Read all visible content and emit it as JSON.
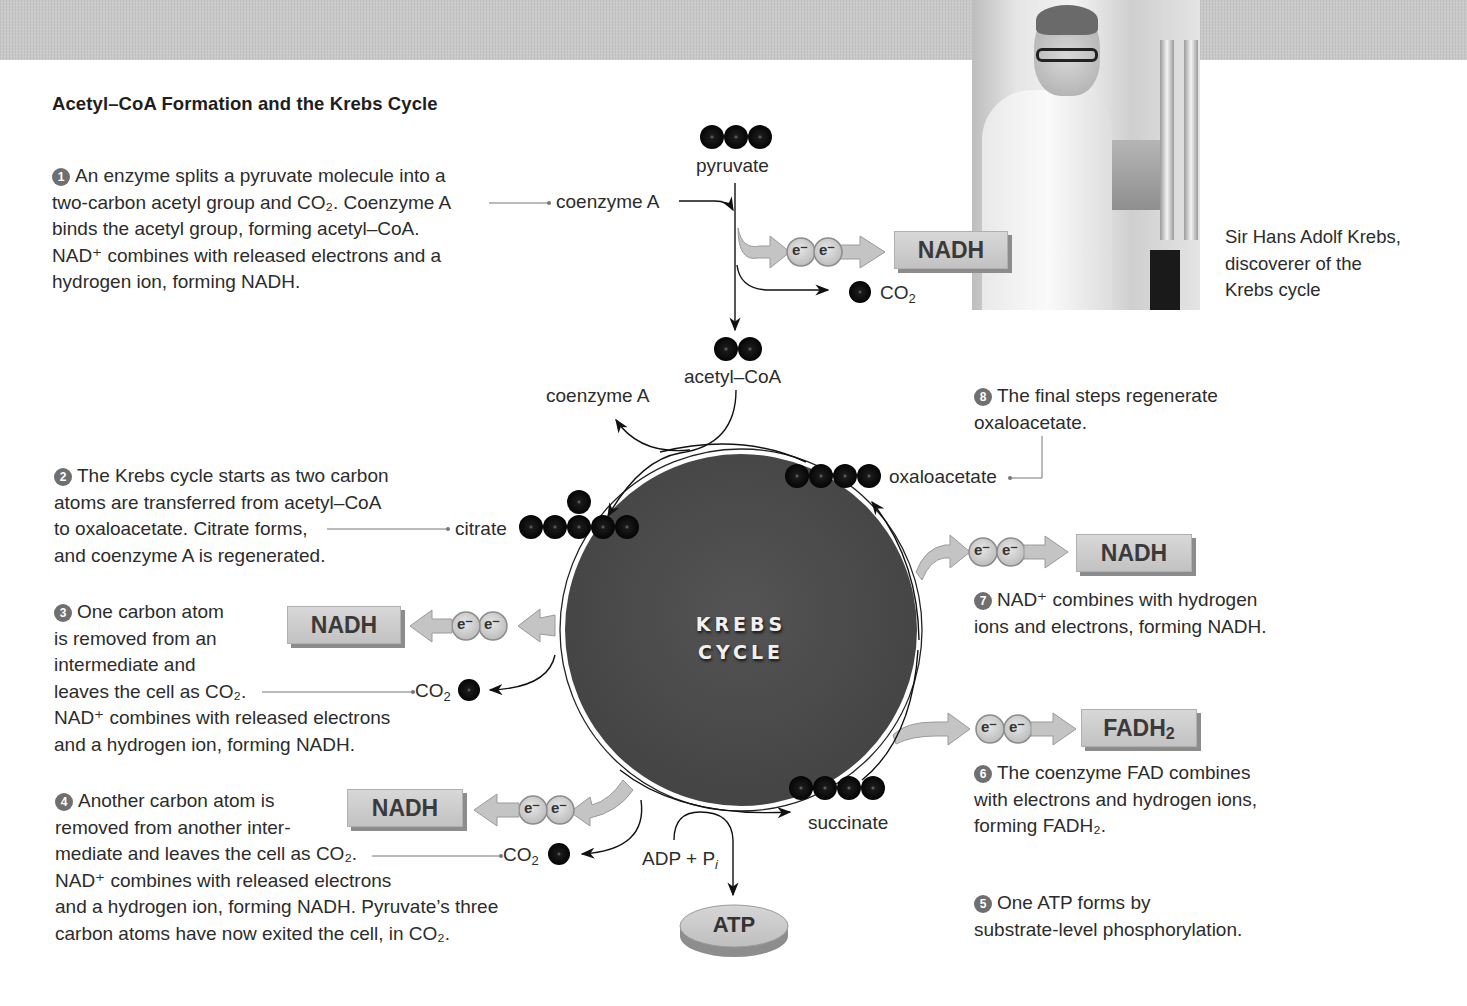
{
  "title": "Acetyl–CoA Formation and the Krebs Cycle",
  "photo_caption": {
    "line1": "Sir Hans Adolf Krebs,",
    "line2": "discoverer of the",
    "line3": "Krebs cycle"
  },
  "cycle_label": {
    "line1": "KREBS",
    "line2": "CYCLE"
  },
  "molecules": {
    "pyruvate": "pyruvate",
    "coenzyme_a_in": "coenzyme A",
    "acetyl_coa": "acetyl–CoA",
    "coenzyme_a_out": "coenzyme A",
    "citrate": "citrate",
    "oxaloacetate": "oxaloacetate",
    "succinate": "succinate",
    "co2": "CO",
    "co2_sub": "2",
    "adp": "ADP + P",
    "adp_sub": "i"
  },
  "products": {
    "nadh_top": "NADH",
    "nadh_step3": "NADH",
    "nadh_step4": "NADH",
    "nadh_step7": "NADH",
    "fadh2": "FADH",
    "fadh2_sub": "2",
    "atp": "ATP",
    "electron": "e⁻"
  },
  "steps": [
    {
      "num": "1",
      "lines": [
        "An enzyme splits a pyruvate molecule into a",
        "two-carbon acetyl group and CO₂. Coenzyme A",
        "binds the acetyl group, forming acetyl–CoA.",
        "NAD⁺ combines with released electrons and a",
        "hydrogen ion, forming NADH."
      ]
    },
    {
      "num": "2",
      "lines": [
        "The Krebs cycle starts as two carbon",
        "atoms are transferred from acetyl–CoA",
        "to oxaloacetate. Citrate forms,",
        "and coenzyme A is regenerated."
      ]
    },
    {
      "num": "3",
      "lines": [
        "One carbon atom",
        "is removed from an",
        "intermediate and",
        "leaves the cell as CO₂.",
        "NAD⁺ combines with released electrons",
        "and a hydrogen ion, forming NADH."
      ]
    },
    {
      "num": "4",
      "lines": [
        "Another carbon atom is",
        "removed from another inter-",
        "mediate and leaves the cell as CO₂.",
        "NAD⁺ combines with released electrons",
        "and a hydrogen ion, forming NADH. Pyruvate’s three",
        "carbon atoms have now exited the cell, in CO₂."
      ]
    },
    {
      "num": "5",
      "lines": [
        "One ATP forms by",
        "substrate-level phosphorylation."
      ]
    },
    {
      "num": "6",
      "lines": [
        "The coenzyme FAD combines",
        "with electrons and hydrogen ions,",
        "forming FADH₂."
      ]
    },
    {
      "num": "7",
      "lines": [
        "NAD⁺ combines with hydrogen",
        "ions and electrons, forming NADH."
      ]
    },
    {
      "num": "8",
      "lines": [
        "The final steps regenerate",
        "oxaloacetate."
      ]
    }
  ],
  "colors": {
    "cycle_fill": "#4a4a4a",
    "carbon_atom": "#111111",
    "product_box": "#c8c8c8",
    "arrow_fill": "#c4c4c4",
    "badge": "#6f6f6f",
    "band": "#c9c9c9"
  }
}
